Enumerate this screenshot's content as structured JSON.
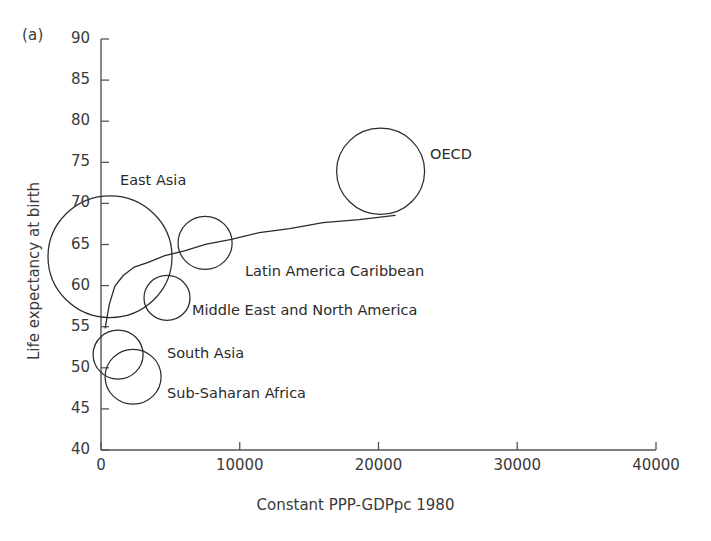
{
  "panel": {
    "tag": "(a)"
  },
  "axes": {
    "ylabel": "Life expectancy at birth",
    "xlabel": "Constant PPP-GDPpc 1980",
    "yticks": [
      "40",
      "45",
      "50",
      "55",
      "60",
      "65",
      "70",
      "75",
      "80",
      "85",
      "90"
    ],
    "xticks": [
      "0",
      "10000",
      "20000",
      "30000",
      "40000"
    ]
  },
  "chart_data": {
    "type": "scatter",
    "title": "",
    "subtitle": "(a)",
    "xlabel": "Constant PPP-GDPpc 1980",
    "ylabel": "Life expectancy at birth",
    "xlim": [
      0,
      40000
    ],
    "ylim": [
      40,
      90
    ],
    "xticks": [
      0,
      10000,
      20000,
      30000,
      40000
    ],
    "yticks": [
      40,
      45,
      50,
      55,
      60,
      65,
      70,
      75,
      80,
      85,
      90
    ],
    "grid": false,
    "legend": false,
    "marker": "open-circle-bubble",
    "bubbles": [
      {
        "name": "East Asia",
        "x": 650,
        "y": 63.5,
        "r_px": 62,
        "label": "East Asia",
        "label_x": 120,
        "label_y": 172
      },
      {
        "name": "OECD",
        "x": 20150,
        "y": 73.9,
        "r_px": 44,
        "label": "OECD",
        "label_x": 430,
        "label_y": 146
      },
      {
        "name": "Latin America Caribbean",
        "x": 7500,
        "y": 65.2,
        "r_px": 27,
        "label": "Latin America Caribbean",
        "label_x": 245,
        "label_y": 263
      },
      {
        "name": "Middle East and North America",
        "x": 4760,
        "y": 58.5,
        "r_px": 23,
        "label": "Middle East and North America",
        "label_x": 192,
        "label_y": 302
      },
      {
        "name": "South Asia",
        "x": 1230,
        "y": 51.6,
        "r_px": 25,
        "label": "South Asia",
        "label_x": 167,
        "label_y": 345
      },
      {
        "name": "Sub-Saharan Africa",
        "x": 2310,
        "y": 48.9,
        "r_px": 28,
        "label": "Sub-Saharan Africa",
        "label_x": 167,
        "label_y": 385
      }
    ],
    "fit_curve": {
      "name": "fitted relationship",
      "x": [
        300,
        600,
        1000,
        1600,
        2400,
        3400,
        4600,
        6000,
        7600,
        9400,
        11400,
        13600,
        16000,
        18600,
        21200
      ],
      "y": [
        54.8,
        57.8,
        59.9,
        61.3,
        62.2,
        62.9,
        63.6,
        64.3,
        65.0,
        65.7,
        66.4,
        67.0,
        67.6,
        68.1,
        68.5
      ]
    },
    "colors": {
      "ink": "#2b2b2b",
      "axis": "#555555",
      "background": "#ffffff"
    }
  },
  "annotations": {
    "east_asia": "East Asia",
    "oecd": "OECD",
    "latin_america": "Latin America Caribbean",
    "middle_east": "Middle East and North America",
    "south_asia": "South Asia",
    "sub_saharan": "Sub-Saharan Africa"
  }
}
